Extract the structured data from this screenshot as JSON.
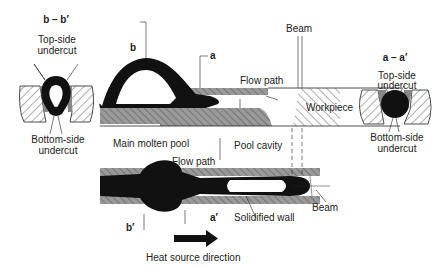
{
  "sections": {
    "bb": {
      "title": "b – b′",
      "top_label": "Top-side undercut",
      "top_l1": "Top-side",
      "top_l2": "undercut",
      "bottom_l1": "Bottom-side",
      "bottom_l2": "undercut"
    },
    "aa": {
      "title": "a – a′",
      "top_l1": "Top-side",
      "top_l2": "undercut",
      "bottom_l1": "Bottom-side",
      "bottom_l2": "undercut"
    }
  },
  "side_view": {
    "marker_b": "b",
    "marker_a": "a",
    "beam": "Beam",
    "flow_path": "Flow path",
    "workpiece": "Workpiece"
  },
  "top_view": {
    "main_molten_pool": "Main molten pool",
    "pool_cavity": "Pool cavity",
    "flow_path": "Flow path",
    "beam": "Beam",
    "solidified_wall": "Solidified wall",
    "marker_b_prime": "b′",
    "marker_a_prime": "a′"
  },
  "direction": {
    "label": "Heat source direction"
  }
}
